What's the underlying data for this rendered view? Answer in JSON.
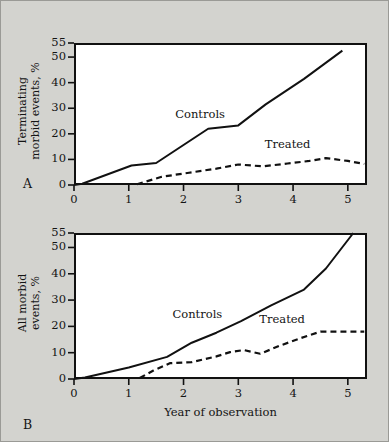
{
  "figure": {
    "background_color": "#d3d3cf",
    "plot_background_color": "#ffffff",
    "line_color": "#111111",
    "panel_a_letter": "A",
    "panel_b_letter": "B"
  },
  "chart_data": [
    {
      "type": "line",
      "panel": "A",
      "title": "",
      "xlabel": "",
      "ylabel": "Terminating morbid events, %",
      "ylabel_line1": "Terminating",
      "ylabel_line2": "morbid events, %",
      "xlim": [
        0,
        5.35
      ],
      "ylim": [
        0,
        55
      ],
      "xticks": [
        0,
        1,
        2,
        3,
        4,
        5
      ],
      "xtick_labels": [
        "0",
        "1",
        "2",
        "3",
        "4",
        "5"
      ],
      "yticks": [
        0,
        10,
        20,
        30,
        40,
        50,
        55
      ],
      "ytick_labels": [
        "0",
        "10",
        "20",
        "30",
        "40",
        "50",
        "55"
      ],
      "grid": false,
      "legend_position": "inline-annotation",
      "series": [
        {
          "name": "Controls",
          "style": "solid",
          "label_x": 2.25,
          "label_y": 27.5,
          "x": [
            0.0,
            0.15,
            1.05,
            1.5,
            2.45,
            3.0,
            3.5,
            4.2,
            4.9
          ],
          "y": [
            0.0,
            0.5,
            7.6,
            8.6,
            22.0,
            23.3,
            31.5,
            41.5,
            52.3
          ]
        },
        {
          "name": "Treated",
          "style": "dashed",
          "label_x": 3.85,
          "label_y": 15.5,
          "x": [
            1.15,
            1.6,
            2.1,
            2.6,
            3.0,
            3.45,
            3.9,
            4.3,
            4.6,
            5.0,
            5.3
          ],
          "y": [
            0.3,
            3.2,
            4.8,
            6.4,
            8.0,
            7.3,
            8.4,
            9.4,
            10.5,
            9.4,
            8.2
          ]
        }
      ]
    },
    {
      "type": "line",
      "panel": "B",
      "title": "",
      "xlabel": "Year of observation",
      "ylabel": "All morbid events, %",
      "ylabel_line1": "All morbid",
      "ylabel_line2": "events, %",
      "xlim": [
        0,
        5.35
      ],
      "ylim": [
        0,
        55
      ],
      "xticks": [
        0,
        1,
        2,
        3,
        4,
        5
      ],
      "xtick_labels": [
        "0",
        "1",
        "2",
        "3",
        "4",
        "5"
      ],
      "yticks": [
        0,
        10,
        20,
        30,
        40,
        50,
        55
      ],
      "ytick_labels": [
        "0",
        "10",
        "20",
        "30",
        "40",
        "50",
        "55"
      ],
      "grid": false,
      "legend_position": "inline-annotation",
      "series": [
        {
          "name": "Controls",
          "style": "solid",
          "label_x": 2.2,
          "label_y": 24.5,
          "x": [
            0.0,
            0.2,
            1.0,
            1.7,
            2.15,
            2.6,
            3.05,
            3.6,
            4.2,
            4.6,
            5.1
          ],
          "y": [
            0.0,
            0.6,
            4.4,
            8.4,
            13.8,
            17.6,
            22.0,
            28.0,
            34.0,
            42.0,
            55.0
          ]
        },
        {
          "name": "Treated",
          "style": "dashed",
          "label_x": 3.75,
          "label_y": 22.5,
          "x": [
            1.2,
            1.45,
            1.75,
            2.15,
            2.6,
            2.85,
            3.1,
            3.4,
            3.75,
            4.15,
            4.5,
            4.9,
            5.3
          ],
          "y": [
            0.4,
            3.2,
            6.0,
            6.4,
            8.6,
            10.2,
            11.0,
            9.6,
            12.6,
            15.6,
            18.0,
            18.0,
            18.0
          ]
        }
      ]
    }
  ]
}
